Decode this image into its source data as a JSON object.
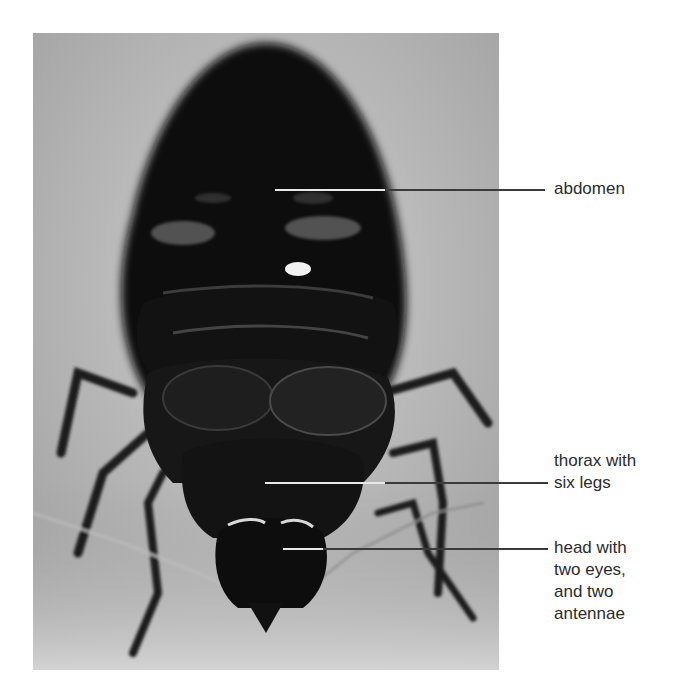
{
  "figure": {
    "labels": [
      {
        "id": "abdomen",
        "text": "abdomen",
        "line_y": 190,
        "line_x_start": 275,
        "line_x_end": 545
      },
      {
        "id": "thorax",
        "text": "thorax with\nsix legs",
        "line_y": 483,
        "line_x_start": 265,
        "line_x_end": 548
      },
      {
        "id": "head",
        "text": "head with\ntwo eyes,\nand two\nantennae",
        "line_y": 549,
        "line_x_start": 283,
        "line_x_end": 548
      }
    ]
  }
}
